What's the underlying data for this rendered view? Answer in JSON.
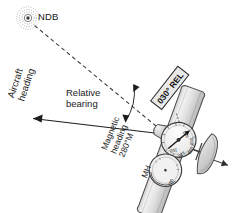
{
  "figure": {
    "type": "aviation-adf-relative-bearing-diagram",
    "background_color": "#ffffff",
    "ink_color": "#1a1a1a"
  },
  "labels": {
    "ndb": "NDB",
    "relative_bearing_line1": "Relative",
    "relative_bearing_line2": "bearing",
    "aircraft_heading_line1": "Aircraft",
    "aircraft_heading_line2": "heading",
    "magnetic_heading_line1": "Magnetic",
    "magnetic_heading_line2": "heading",
    "magnetic_heading_line3": "280°M",
    "mh_abbrev": "MH",
    "relative_bearing_callout": "030° REL"
  },
  "adf_dial": {
    "name": "adf-indicator",
    "needle_bearing_deg": 30,
    "tick_labels": [
      "030",
      "060",
      "090",
      "120",
      "150",
      "180",
      "210",
      "240",
      "270",
      "300",
      "330",
      "360"
    ],
    "visible_numbers": [
      "030",
      "060",
      "090",
      "120",
      "150"
    ]
  },
  "compass": {
    "name": "magnetic-compass",
    "heading": "280",
    "visible_numbers": [
      "280"
    ]
  },
  "icons": {
    "ndb_station": "ndb-station-icon",
    "aircraft": "aircraft-top-view-icon",
    "propeller": "propeller-icon",
    "heading_arrow": "heading-arrow-icon",
    "bearing_arrow": "bearing-pointer-arrow-icon",
    "bearing_arc": "angle-arc-icon",
    "dashed_bearing_line": "dashed-bearing-line-icon"
  }
}
